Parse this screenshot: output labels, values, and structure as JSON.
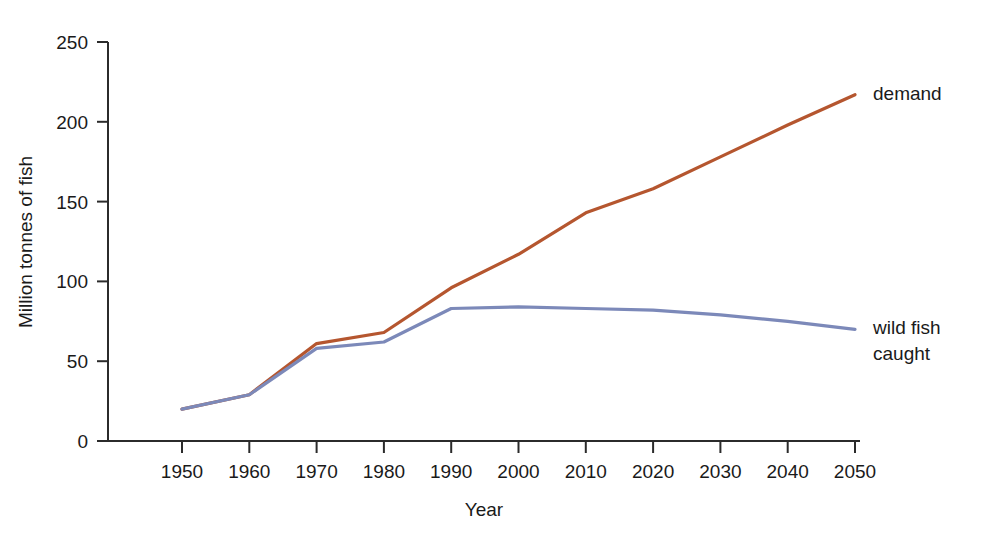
{
  "chart_data": {
    "type": "line",
    "title": "",
    "xlabel": "Year",
    "ylabel": "Million tonnes of fish",
    "x": [
      1950,
      1960,
      1970,
      1980,
      1990,
      2000,
      2010,
      2020,
      2030,
      2040,
      2050
    ],
    "xtick_labels": [
      "1950",
      "1960",
      "1970",
      "1980",
      "1990",
      "2000",
      "2010",
      "2020",
      "2030",
      "2040",
      "2050"
    ],
    "ytick_labels": [
      "0",
      "50",
      "100",
      "150",
      "200",
      "250"
    ],
    "yticks": [
      0,
      50,
      100,
      150,
      200,
      250
    ],
    "xlim": [
      1945,
      2055
    ],
    "ylim": [
      0,
      250
    ],
    "grid": false,
    "legend_position": "right-inline",
    "series": [
      {
        "name": "demand",
        "label_lines": [
          "demand"
        ],
        "color": "#b5562f",
        "values": [
          20,
          29,
          61,
          68,
          96,
          117,
          143,
          158,
          178,
          198,
          217
        ]
      },
      {
        "name": "wild fish caught",
        "label_lines": [
          "wild fish",
          "caught"
        ],
        "color": "#7c89b9",
        "values": [
          20,
          29,
          58,
          62,
          83,
          84,
          83,
          82,
          79,
          75,
          70
        ]
      }
    ]
  },
  "axis": {
    "x_title": "Year",
    "y_title": "Million tonnes of fish",
    "axis_color": "#2b2b2b"
  }
}
